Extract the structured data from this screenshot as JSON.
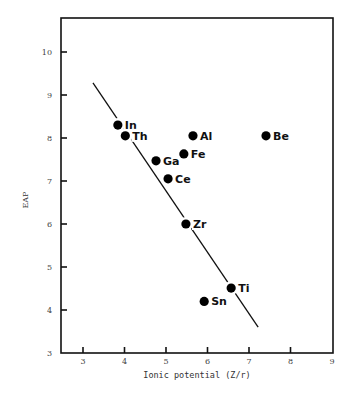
{
  "chart_data": {
    "type": "scatter",
    "title": "",
    "xlabel": "Ionic potential (Z/r)",
    "ylabel": "EAP",
    "xlim": [
      2.5,
      9
    ],
    "ylim": [
      3,
      10.8
    ],
    "xticks": [
      3,
      4,
      5,
      6,
      7,
      8,
      9
    ],
    "yticks": [
      3,
      4,
      5,
      6,
      7,
      8,
      9,
      10
    ],
    "grid": false,
    "legend": null,
    "points": [
      {
        "label": "In",
        "x": 3.84,
        "y": 8.3
      },
      {
        "label": "Th",
        "x": 4.02,
        "y": 8.05
      },
      {
        "label": "Ga",
        "x": 4.76,
        "y": 7.47
      },
      {
        "label": "Ce",
        "x": 5.05,
        "y": 7.05
      },
      {
        "label": "Fe",
        "x": 5.43,
        "y": 7.63
      },
      {
        "label": "Al",
        "x": 5.65,
        "y": 8.05
      },
      {
        "label": "Be",
        "x": 7.41,
        "y": 8.05
      },
      {
        "label": "Zr",
        "x": 5.48,
        "y": 6.0
      },
      {
        "label": "Ti",
        "x": 6.57,
        "y": 4.51
      },
      {
        "label": "Sn",
        "x": 5.92,
        "y": 4.2
      }
    ],
    "fit_line": {
      "x1": 3.24,
      "y1": 9.28,
      "x2": 7.22,
      "y2": 3.6
    }
  }
}
